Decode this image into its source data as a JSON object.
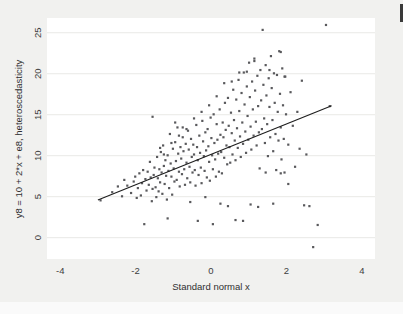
{
  "figure": {
    "background_color": "#f1f1ef",
    "plot_background_color": "#ffffff",
    "point_color": "#59595c",
    "line_color": "#1d1d1d",
    "gridline_color": "#e9e9e6",
    "tick_label_color": "#3d3d3d"
  },
  "chart_data": {
    "type": "scatter",
    "title": "",
    "subtitle": "",
    "xlabel": "Standard normal x",
    "ylabel": "y8 = 10 + 2*x + e8, heteroscedasticity",
    "xlim": [
      -4.35,
      4.35
    ],
    "ylim": [
      -2.6,
      26.8
    ],
    "xticks": [
      -4,
      -2,
      0,
      2,
      4
    ],
    "xtick_labels": [
      "-4",
      "-2",
      "0",
      "2",
      "4"
    ],
    "yticks": [
      0,
      5,
      10,
      15,
      20,
      25
    ],
    "ytick_labels": [
      "0",
      "5",
      "10",
      "15",
      "20",
      "25"
    ],
    "grid": "horizontal",
    "legend": "none",
    "n_points": 500,
    "marker": "filled-square",
    "marker_size_px": 2.2,
    "series": [
      {
        "name": "y8 observations",
        "model": "y8 = 10 + 2*x + e8 where sd(e8) grows with x (heteroscedasticity)",
        "intercept": 10,
        "slope": 2,
        "points": [
          [
            -2.93,
            4.55
          ],
          [
            -2.62,
            5.55
          ],
          [
            -2.47,
            6.25
          ],
          [
            -2.36,
            5.05
          ],
          [
            -2.3,
            7.05
          ],
          [
            -2.22,
            6.35
          ],
          [
            -2.12,
            5.45
          ],
          [
            -2.05,
            6.85
          ],
          [
            -2.01,
            7.45
          ],
          [
            -1.97,
            4.85
          ],
          [
            -1.94,
            6.05
          ],
          [
            -1.9,
            7.85
          ],
          [
            -1.86,
            5.15
          ],
          [
            -1.83,
            6.65
          ],
          [
            -1.8,
            8.25
          ],
          [
            -1.77,
            1.65
          ],
          [
            -1.74,
            7.15
          ],
          [
            -1.71,
            5.75
          ],
          [
            -1.68,
            8.05
          ],
          [
            -1.65,
            6.45
          ],
          [
            -1.62,
            9.25
          ],
          [
            -1.6,
            7.35
          ],
          [
            -1.57,
            4.45
          ],
          [
            -1.55,
            5.95
          ],
          [
            -1.52,
            7.65
          ],
          [
            -1.5,
            8.55
          ],
          [
            -1.47,
            6.15
          ],
          [
            -1.45,
            4.95
          ],
          [
            -1.43,
            9.85
          ],
          [
            -1.41,
            7.25
          ],
          [
            -1.39,
            5.65
          ],
          [
            -1.37,
            8.35
          ],
          [
            -1.35,
            6.75
          ],
          [
            -1.33,
            10.45
          ],
          [
            -1.31,
            7.95
          ],
          [
            -1.29,
            5.35
          ],
          [
            -1.27,
            11.25
          ],
          [
            -1.25,
            8.75
          ],
          [
            -1.23,
            6.55
          ],
          [
            -1.21,
            9.45
          ],
          [
            -1.19,
            7.55
          ],
          [
            -1.17,
            4.65
          ],
          [
            -1.15,
            10.05
          ],
          [
            -1.13,
            8.15
          ],
          [
            -1.11,
            6.05
          ],
          [
            -1.09,
            12.65
          ],
          [
            -1.07,
            9.05
          ],
          [
            -1.05,
            7.45
          ],
          [
            -1.03,
            5.25
          ],
          [
            -1.01,
            10.85
          ],
          [
            -0.99,
            8.45
          ],
          [
            -0.97,
            6.85
          ],
          [
            -0.95,
            11.65
          ],
          [
            -0.93,
            9.35
          ],
          [
            -0.91,
            7.05
          ],
          [
            -0.89,
            13.45
          ],
          [
            -0.87,
            10.25
          ],
          [
            -0.85,
            8.05
          ],
          [
            -0.83,
            6.25
          ],
          [
            -0.81,
            11.05
          ],
          [
            -0.79,
            9.65
          ],
          [
            -0.77,
            7.75
          ],
          [
            -0.75,
            12.25
          ],
          [
            -0.73,
            10.55
          ],
          [
            -0.71,
            8.35
          ],
          [
            -0.69,
            6.45
          ],
          [
            -0.67,
            11.45
          ],
          [
            -0.65,
            9.15
          ],
          [
            -0.63,
            7.25
          ],
          [
            -0.61,
            13.05
          ],
          [
            -0.59,
            10.75
          ],
          [
            -0.57,
            8.65
          ],
          [
            -0.55,
            6.75
          ],
          [
            -0.53,
            12.05
          ],
          [
            -0.51,
            9.85
          ],
          [
            -0.49,
            7.95
          ],
          [
            -0.47,
            11.35
          ],
          [
            -0.45,
            10.15
          ],
          [
            -0.43,
            8.25
          ],
          [
            -0.41,
            6.35
          ],
          [
            -0.39,
            13.75
          ],
          [
            -0.37,
            11.05
          ],
          [
            -0.35,
            9.45
          ],
          [
            -0.33,
            7.65
          ],
          [
            -0.31,
            12.45
          ],
          [
            -0.29,
            10.35
          ],
          [
            -0.27,
            8.55
          ],
          [
            -0.25,
            6.65
          ],
          [
            -0.23,
            14.25
          ],
          [
            -0.21,
            11.75
          ],
          [
            -0.19,
            9.95
          ],
          [
            -0.17,
            8.15
          ],
          [
            -0.15,
            12.85
          ],
          [
            -0.13,
            10.65
          ],
          [
            -0.11,
            7.35
          ],
          [
            -0.09,
            13.25
          ],
          [
            -0.07,
            11.15
          ],
          [
            -0.05,
            9.25
          ],
          [
            -0.03,
            6.95
          ],
          [
            -0.01,
            14.65
          ],
          [
            0.01,
            12.15
          ],
          [
            0.03,
            10.05
          ],
          [
            0.05,
            8.35
          ],
          [
            0.07,
            15.05
          ],
          [
            0.09,
            11.55
          ],
          [
            0.11,
            9.55
          ],
          [
            0.13,
            7.45
          ],
          [
            0.15,
            13.85
          ],
          [
            0.17,
            11.95
          ],
          [
            0.19,
            10.25
          ],
          [
            0.21,
            8.05
          ],
          [
            0.23,
            15.65
          ],
          [
            0.25,
            12.55
          ],
          [
            0.27,
            10.45
          ],
          [
            0.29,
            7.85
          ],
          [
            0.31,
            14.05
          ],
          [
            0.33,
            12.25
          ],
          [
            0.35,
            9.75
          ],
          [
            0.37,
            16.45
          ],
          [
            0.39,
            13.15
          ],
          [
            0.41,
            11.25
          ],
          [
            0.43,
            8.95
          ],
          [
            0.45,
            17.05
          ],
          [
            0.47,
            13.65
          ],
          [
            0.49,
            11.05
          ],
          [
            0.51,
            9.15
          ],
          [
            0.53,
            15.25
          ],
          [
            0.55,
            12.75
          ],
          [
            0.57,
            10.15
          ],
          [
            0.59,
            18.05
          ],
          [
            0.61,
            14.35
          ],
          [
            0.63,
            11.85
          ],
          [
            0.65,
            9.45
          ],
          [
            0.67,
            16.85
          ],
          [
            0.69,
            13.35
          ],
          [
            0.71,
            10.95
          ],
          [
            0.73,
            19.25
          ],
          [
            0.75,
            15.45
          ],
          [
            0.77,
            12.35
          ],
          [
            0.79,
            9.85
          ],
          [
            0.81,
            17.65
          ],
          [
            0.83,
            14.05
          ],
          [
            0.85,
            11.45
          ],
          [
            0.87,
            20.15
          ],
          [
            0.89,
            16.25
          ],
          [
            0.91,
            12.95
          ],
          [
            0.93,
            10.35
          ],
          [
            0.95,
            18.45
          ],
          [
            0.97,
            14.85
          ],
          [
            0.99,
            11.95
          ],
          [
            1.01,
            21.35
          ],
          [
            1.03,
            17.15
          ],
          [
            1.05,
            13.55
          ],
          [
            1.07,
            10.75
          ],
          [
            1.09,
            19.05
          ],
          [
            1.11,
            15.65
          ],
          [
            1.13,
            12.45
          ],
          [
            1.15,
            21.85
          ],
          [
            1.17,
            17.95
          ],
          [
            1.19,
            14.15
          ],
          [
            1.21,
            11.25
          ],
          [
            1.23,
            19.75
          ],
          [
            1.25,
            16.05
          ],
          [
            1.27,
            12.85
          ],
          [
            1.29,
            8.45
          ],
          [
            1.31,
            20.45
          ],
          [
            1.33,
            16.75
          ],
          [
            1.35,
            13.25
          ],
          [
            1.37,
            25.35
          ],
          [
            1.39,
            18.65
          ],
          [
            1.41,
            14.55
          ],
          [
            1.43,
            11.55
          ],
          [
            1.45,
            21.05
          ],
          [
            1.47,
            17.35
          ],
          [
            1.49,
            13.85
          ],
          [
            1.51,
            9.95
          ],
          [
            1.53,
            19.45
          ],
          [
            1.55,
            15.95
          ],
          [
            1.57,
            12.25
          ],
          [
            1.59,
            22.15
          ],
          [
            1.61,
            18.25
          ],
          [
            1.63,
            14.35
          ],
          [
            1.65,
            10.55
          ],
          [
            1.67,
            20.05
          ],
          [
            1.69,
            16.45
          ],
          [
            1.71,
            12.65
          ],
          [
            1.73,
            8.25
          ],
          [
            1.75,
            19.85
          ],
          [
            1.77,
            15.35
          ],
          [
            1.79,
            11.85
          ],
          [
            1.81,
            22.75
          ],
          [
            1.83,
            17.55
          ],
          [
            1.85,
            13.45
          ],
          [
            1.87,
            9.55
          ],
          [
            1.89,
            20.65
          ],
          [
            1.91,
            16.15
          ],
          [
            1.93,
            12.05
          ],
          [
            1.95,
            7.95
          ],
          [
            1.97,
            19.65
          ],
          [
            1.99,
            15.05
          ],
          [
            2.05,
            11.35
          ],
          [
            2.11,
            17.75
          ],
          [
            2.17,
            13.65
          ],
          [
            2.23,
            8.65
          ],
          [
            2.29,
            15.35
          ],
          [
            2.35,
            10.85
          ],
          [
            2.41,
            19.15
          ],
          [
            2.47,
            3.95
          ],
          [
            2.53,
            10.15
          ],
          [
            2.61,
            3.85
          ],
          [
            2.71,
            -1.15
          ],
          [
            2.83,
            1.55
          ],
          [
            3.05,
            25.95
          ],
          [
            3.15,
            16.05
          ],
          [
            -1.55,
            14.75
          ],
          [
            -1.35,
            10.95
          ],
          [
            -1.15,
            2.35
          ],
          [
            -0.95,
            14.05
          ],
          [
            -0.75,
            13.45
          ],
          [
            -0.55,
            4.35
          ],
          [
            -0.35,
            2.05
          ],
          [
            -0.15,
            4.95
          ],
          [
            0.05,
            1.65
          ],
          [
            0.25,
            4.15
          ],
          [
            0.45,
            3.85
          ],
          [
            0.65,
            2.15
          ],
          [
            0.85,
            2.05
          ],
          [
            1.05,
            4.05
          ],
          [
            1.25,
            3.75
          ],
          [
            1.45,
            7.95
          ],
          [
            1.65,
            4.15
          ],
          [
            1.85,
            7.85
          ],
          [
            2.05,
            6.55
          ],
          [
            0.95,
            20.25
          ],
          [
            0.75,
            20.15
          ],
          [
            1.15,
            21.55
          ],
          [
            1.55,
            20.45
          ],
          [
            1.85,
            22.65
          ],
          [
            1.95,
            19.65
          ],
          [
            0.55,
            19.05
          ],
          [
            0.35,
            18.85
          ],
          [
            0.15,
            17.25
          ],
          [
            -0.05,
            16.15
          ],
          [
            -0.25,
            15.35
          ],
          [
            -0.45,
            14.55
          ],
          [
            -0.65,
            13.25
          ],
          [
            -0.85,
            12.45
          ],
          [
            -1.05,
            11.55
          ],
          [
            -1.25,
            10.15
          ]
        ]
      }
    ],
    "fit_line": {
      "name": "linear fit",
      "x_start": -3.0,
      "y_start": 4.6,
      "x_end": 3.2,
      "y_end": 16.1
    }
  }
}
